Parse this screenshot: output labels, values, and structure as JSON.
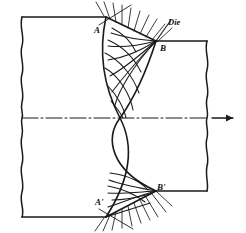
{
  "figure": {
    "type": "engineering-line-diagram",
    "width": 246,
    "height": 233,
    "stroke_color": "#1a1a1a",
    "background_color": "#ffffff"
  },
  "labels": {
    "die": "Die",
    "point_a": "A",
    "point_b": "B",
    "point_a_prime": "A'",
    "point_b_prime": "B'"
  },
  "geometry": {
    "centerline_y": 118,
    "entry_top_y": 17,
    "entry_bottom_y": 217,
    "exit_top_y": 41,
    "exit_bottom_y": 191,
    "point_a": [
      106,
      17
    ],
    "point_b": [
      156,
      41
    ],
    "point_a_prime": [
      106,
      217
    ],
    "point_b_prime": [
      156,
      191
    ],
    "flow_direction": "left-to-right",
    "break_line_left_x": 22,
    "break_line_right_x": 207
  },
  "elements": {
    "centerline_style": "dash-dot",
    "arrow_label": "flow-direction-arrow",
    "hatching_top": "die-face-hatching-upper",
    "hatching_bottom": "die-face-hatching-lower",
    "slipline_net": "orthogonal-slip-line-net",
    "break_lines": "wavy-section-break"
  }
}
